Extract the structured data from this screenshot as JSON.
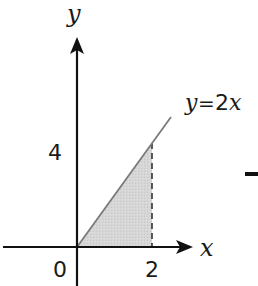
{
  "diagram": {
    "type": "coordinate-plot-region",
    "axes": {
      "x_label": "x",
      "y_label": "y"
    },
    "ticks": {
      "origin": "0",
      "x_tick": "2",
      "y_tick": "4"
    },
    "curve": {
      "equation_label": "y = 2x",
      "equation_lhs": "y",
      "equation_eq": "=",
      "equation_rhs_num": "2",
      "equation_rhs_var": "x"
    },
    "shaded_region": {
      "description": "triangle bounded by y=2x, x-axis, and x=2",
      "vertices": [
        [
          0,
          0
        ],
        [
          2,
          0
        ],
        [
          2,
          4
        ]
      ],
      "fill": "#d4d4d4"
    },
    "colors": {
      "axis": "#111111",
      "curve": "#7a7a7a",
      "shade": "#d4d4d4",
      "dash": "#333333"
    },
    "extra_mark": "–"
  }
}
